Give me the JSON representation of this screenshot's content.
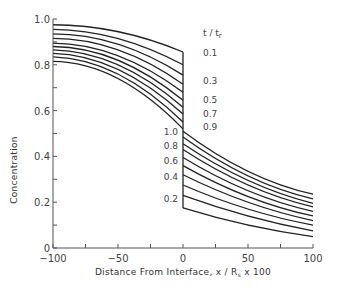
{
  "chart_data": {
    "type": "line",
    "title": "",
    "xlabel": "Distance From Interface, x / R_s x 100",
    "ylabel": "Concentration",
    "xlim": [
      -100,
      100
    ],
    "ylim": [
      0,
      1.0
    ],
    "x_ticks": [
      -100,
      -50,
      0,
      50,
      100
    ],
    "y_ticks": [
      0,
      0.2,
      0.4,
      0.6,
      0.8,
      1.0
    ],
    "x_tick_labels": [
      "-100",
      "-50",
      "0",
      "50",
      "100"
    ],
    "y_tick_labels": [
      "0",
      "0.2",
      "0.4",
      "0.6",
      "0.8",
      "1.0"
    ],
    "legend_title": "t / t_r",
    "grid": false,
    "series": [
      {
        "name": "0.1",
        "left_x": [
          -100,
          -50,
          0
        ],
        "left_y": [
          0.975,
          0.945,
          0.856
        ],
        "right_x": [
          0,
          50,
          100
        ],
        "right_y": [
          0.175,
          0.1,
          0.05
        ]
      },
      {
        "name": "0.2",
        "left_x": [
          -100,
          -50,
          0
        ],
        "left_y": [
          0.955,
          0.915,
          0.8
        ],
        "right_x": [
          0,
          50,
          100
        ],
        "right_y": [
          0.23,
          0.14,
          0.075
        ]
      },
      {
        "name": "0.3",
        "left_x": [
          -100,
          -50,
          0
        ],
        "left_y": [
          0.935,
          0.89,
          0.755
        ],
        "right_x": [
          0,
          50,
          100
        ],
        "right_y": [
          0.275,
          0.17,
          0.1
        ]
      },
      {
        "name": "0.4",
        "left_x": [
          -100,
          -50,
          0
        ],
        "left_y": [
          0.915,
          0.865,
          0.715
        ],
        "right_x": [
          0,
          50,
          100
        ],
        "right_y": [
          0.32,
          0.2,
          0.12
        ]
      },
      {
        "name": "0.5",
        "left_x": [
          -100,
          -50,
          0
        ],
        "left_y": [
          0.895,
          0.84,
          0.68
        ],
        "right_x": [
          0,
          50,
          100
        ],
        "right_y": [
          0.36,
          0.225,
          0.14
        ]
      },
      {
        "name": "0.6",
        "left_x": [
          -100,
          -50,
          0
        ],
        "left_y": [
          0.88,
          0.82,
          0.645
        ],
        "right_x": [
          0,
          50,
          100
        ],
        "right_y": [
          0.395,
          0.25,
          0.16
        ]
      },
      {
        "name": "0.7",
        "left_x": [
          -100,
          -50,
          0
        ],
        "left_y": [
          0.865,
          0.8,
          0.615
        ],
        "right_x": [
          0,
          50,
          100
        ],
        "right_y": [
          0.43,
          0.275,
          0.18
        ]
      },
      {
        "name": "0.8",
        "left_x": [
          -100,
          -50,
          0
        ],
        "left_y": [
          0.85,
          0.78,
          0.585
        ],
        "right_x": [
          0,
          50,
          100
        ],
        "right_y": [
          0.455,
          0.295,
          0.195
        ]
      },
      {
        "name": "0.9",
        "left_x": [
          -100,
          -50,
          0
        ],
        "left_y": [
          0.835,
          0.76,
          0.55
        ],
        "right_x": [
          0,
          50,
          100
        ],
        "right_y": [
          0.485,
          0.315,
          0.215
        ]
      },
      {
        "name": "1.0",
        "left_x": [
          -100,
          -50,
          0
        ],
        "left_y": [
          0.815,
          0.74,
          0.52
        ],
        "right_x": [
          0,
          50,
          100
        ],
        "right_y": [
          0.51,
          0.335,
          0.235
        ]
      }
    ],
    "annotations": {
      "upper_labels": [
        "0.1",
        "0.3",
        "0.5",
        "0.7",
        "0.9"
      ],
      "lower_labels": [
        "1.0",
        "0.8",
        "0.6",
        "0.4",
        "0.2"
      ]
    }
  }
}
